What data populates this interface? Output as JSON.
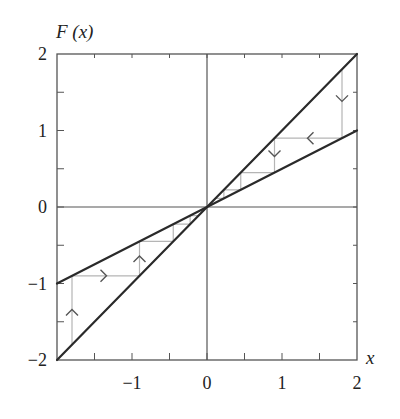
{
  "chart_data": {
    "type": "line",
    "title": "",
    "xlabel": "x",
    "ylabel": "F (x)",
    "xlim": [
      -2,
      2
    ],
    "ylim": [
      -2,
      2
    ],
    "grid": false,
    "x_ticks": [
      -1,
      0,
      1,
      2
    ],
    "x_tick_labels": [
      "−1",
      "0",
      "1",
      "2"
    ],
    "y_ticks": [
      -2,
      -1,
      0,
      1,
      2
    ],
    "y_tick_labels": [
      "−2",
      "−1",
      "0",
      "1",
      "2"
    ],
    "minor_tick_step": 0.5,
    "series": [
      {
        "name": "y = x",
        "x": [
          -2,
          2
        ],
        "y": [
          -2,
          2
        ],
        "color": "#2a2a2a",
        "width": 2.2
      },
      {
        "name": "F(x) = x/2",
        "x": [
          -2,
          2
        ],
        "y": [
          -1,
          1
        ],
        "color": "#2a2a2a",
        "width": 2.2
      }
    ],
    "cobwebs": [
      {
        "name": "cobweb-right",
        "points": [
          [
            1.8,
            1.8
          ],
          [
            1.8,
            0.9
          ],
          [
            0.9,
            0.9
          ],
          [
            0.9,
            0.45
          ],
          [
            0.45,
            0.45
          ],
          [
            0.45,
            0.225
          ],
          [
            0.225,
            0.225
          ],
          [
            0.225,
            0.1125
          ],
          [
            0.1125,
            0.1125
          ]
        ],
        "arrows": [
          {
            "x": 1.8,
            "y": 1.42,
            "dir": "down"
          },
          {
            "x": 1.38,
            "y": 0.9,
            "dir": "left"
          },
          {
            "x": 0.9,
            "y": 0.7,
            "dir": "down"
          }
        ]
      },
      {
        "name": "cobweb-left",
        "points": [
          [
            -1.8,
            -1.8
          ],
          [
            -1.8,
            -0.9
          ],
          [
            -0.9,
            -0.9
          ],
          [
            -0.9,
            -0.45
          ],
          [
            -0.45,
            -0.45
          ],
          [
            -0.45,
            -0.225
          ],
          [
            -0.225,
            -0.225
          ],
          [
            -0.225,
            -0.1125
          ],
          [
            -0.1125,
            -0.1125
          ]
        ],
        "arrows": [
          {
            "x": -1.8,
            "y": -1.38,
            "dir": "up"
          },
          {
            "x": -1.38,
            "y": -0.9,
            "dir": "right"
          },
          {
            "x": -0.9,
            "y": -0.68,
            "dir": "up"
          }
        ]
      }
    ],
    "cobweb_color": "#b5b5b5",
    "arrow_color": "#555555",
    "axis_color": "#555555"
  }
}
